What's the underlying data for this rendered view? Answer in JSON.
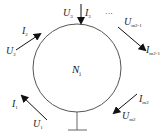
{
  "diagram": {
    "node": {
      "label": "N",
      "subscript": "i"
    },
    "ports": [
      {
        "id": "port-3",
        "current": {
          "label": "I",
          "sub": "3"
        },
        "voltage": {
          "label": "U",
          "sub": "3"
        },
        "direction": "in"
      },
      {
        "id": "port-2",
        "current": {
          "label": "I",
          "sub": "2"
        },
        "voltage": {
          "label": "U",
          "sub": "2"
        },
        "direction": "in"
      },
      {
        "id": "port-1",
        "current": {
          "label": "I",
          "sub": "1"
        },
        "voltage": {
          "label": "U",
          "sub": "1"
        },
        "direction": "in"
      },
      {
        "id": "port-m2-1",
        "current": {
          "label": "I",
          "sub": "m2-1"
        },
        "voltage": {
          "label": "U",
          "sub": "m2-1"
        },
        "direction": "out"
      },
      {
        "id": "port-m2",
        "current": {
          "label": "I",
          "sub": "m2"
        },
        "voltage": {
          "label": "U",
          "sub": "m2"
        },
        "direction": "out"
      }
    ],
    "ellipsis": "···",
    "ground": true,
    "colors": {
      "stroke": "#555555",
      "text": "#222222",
      "background": "#ffffff"
    }
  }
}
